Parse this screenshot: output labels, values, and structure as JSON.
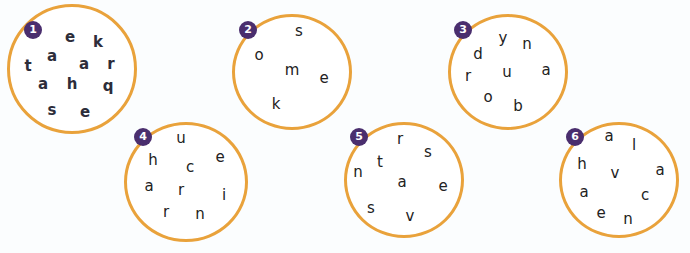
{
  "puzzles": [
    {
      "number": "1",
      "letters": [
        "e",
        "k",
        "a",
        "a",
        "r",
        "t",
        "a",
        "h",
        "q",
        "s",
        "e"
      ]
    },
    {
      "number": "2",
      "letters": [
        "s",
        "o",
        "m",
        "e",
        "k"
      ]
    },
    {
      "number": "3",
      "letters": [
        "y",
        "n",
        "d",
        "r",
        "u",
        "a",
        "o",
        "b"
      ]
    },
    {
      "number": "4",
      "letters": [
        "u",
        "h",
        "e",
        "c",
        "a",
        "r",
        "i",
        "r",
        "n"
      ]
    },
    {
      "number": "5",
      "letters": [
        "r",
        "s",
        "t",
        "n",
        "a",
        "e",
        "s",
        "v"
      ]
    },
    {
      "number": "6",
      "letters": [
        "a",
        "l",
        "h",
        "v",
        "a",
        "a",
        "c",
        "e",
        "n"
      ]
    }
  ],
  "colors": {
    "circle_stroke": "#e9a23b",
    "badge": "#4a2e6e",
    "background": "#fbfdfe"
  }
}
